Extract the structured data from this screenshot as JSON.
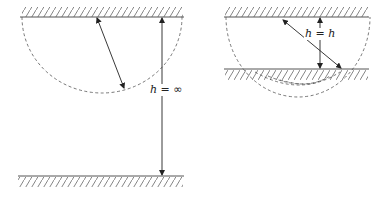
{
  "figures": [
    {
      "id": "left",
      "label_var": "h",
      "label_eq": " = ",
      "label_val": "∞",
      "description": "Half-disk below a single wall; other wall infinitely far"
    },
    {
      "id": "right",
      "label_var": "h",
      "label_eq": " = ",
      "label_val": "h",
      "description": "Half-disk cut by a second wall at distance h"
    }
  ],
  "colors": {
    "line": "#555555",
    "arrow": "#222222",
    "background": "#ffffff"
  }
}
